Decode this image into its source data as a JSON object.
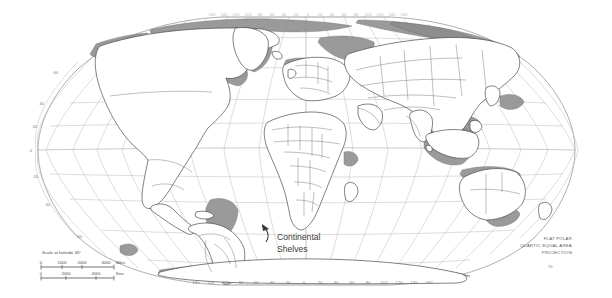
{
  "map": {
    "title_annotation": "Continental Shelves",
    "projection_lines": [
      "FLAT POLAR",
      "QUARTIC EQUAL AREA",
      "PROJECTION"
    ],
    "background_color": "#ffffff",
    "land_fill": "#ffffff",
    "land_stroke": "#4a4a4a",
    "shelf_fill": "#8d8d8d",
    "graticule_color": "#b9b2aa",
    "graticule_interval_degrees": 20
  },
  "scale": {
    "caption": "Scale at latitude 35°",
    "miles": {
      "unit_label": "Miles",
      "ticks": [
        "0",
        "1000",
        "2000",
        "4000"
      ]
    },
    "kms": {
      "unit_label": "Kms",
      "ticks": [
        "0",
        "2000",
        "4000"
      ]
    }
  },
  "graticule_labels": {
    "latitudes_left_north": [
      "60",
      "40",
      "20",
      "0"
    ],
    "latitudes_left_south": [
      "20",
      "40",
      "60"
    ],
    "latitudes_right_south": [
      "70"
    ],
    "longitudes_bottom": [
      "140",
      "120",
      "100",
      "80",
      "60",
      "40",
      "20",
      "0",
      "20",
      "40",
      "60",
      "80",
      "100",
      "120",
      "140",
      "160"
    ],
    "longitudes_top": [
      "160",
      "140",
      "120",
      "100",
      "80",
      "60",
      "40",
      "20",
      "0",
      "20",
      "40",
      "60",
      "80",
      "100",
      "120",
      "140",
      "160"
    ]
  }
}
